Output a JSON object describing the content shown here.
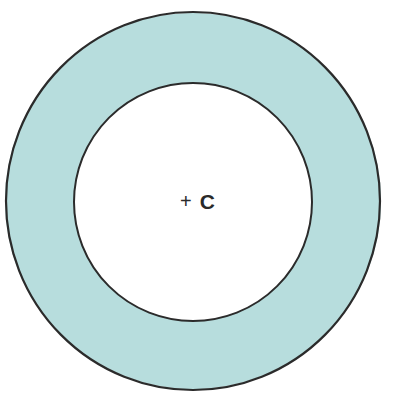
{
  "diagram": {
    "type": "annulus",
    "center_marker": "+",
    "center_label": "C",
    "colors": {
      "ring_fill": "#b7dddd",
      "inner_fill": "#ffffff",
      "stroke": "#2b2b2b",
      "background": "#ffffff"
    },
    "geometry": {
      "center": [
        193,
        201
      ],
      "outer_radius": 188,
      "inner_radius": 119
    }
  }
}
